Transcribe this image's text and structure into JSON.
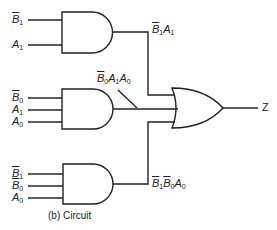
{
  "caption": "(b)  Circuit",
  "output_label": "Z",
  "gate1": {
    "type": "AND",
    "inputs": [
      {
        "var": "B",
        "sub": "1",
        "bar": true
      },
      {
        "var": "A",
        "sub": "1",
        "bar": false
      }
    ],
    "output_term": "B̄1A1"
  },
  "gate2": {
    "type": "AND",
    "inputs": [
      {
        "var": "B",
        "sub": "0",
        "bar": true
      },
      {
        "var": "A",
        "sub": "1",
        "bar": false
      },
      {
        "var": "A",
        "sub": "0",
        "bar": false
      }
    ],
    "output_term": "B̄0A1A0"
  },
  "gate3": {
    "type": "AND",
    "inputs": [
      {
        "var": "B",
        "sub": "1",
        "bar": true
      },
      {
        "var": "B",
        "sub": "0",
        "bar": true
      },
      {
        "var": "A",
        "sub": "0",
        "bar": false
      }
    ],
    "output_term": "B̄1B̄0A0"
  },
  "or_gate": {
    "type": "OR",
    "inputs": 3
  },
  "text": {
    "B": "B",
    "A": "A",
    "s0": "0",
    "s1": "1"
  },
  "colors": {
    "line": "#222222",
    "background": "#ffffff"
  }
}
